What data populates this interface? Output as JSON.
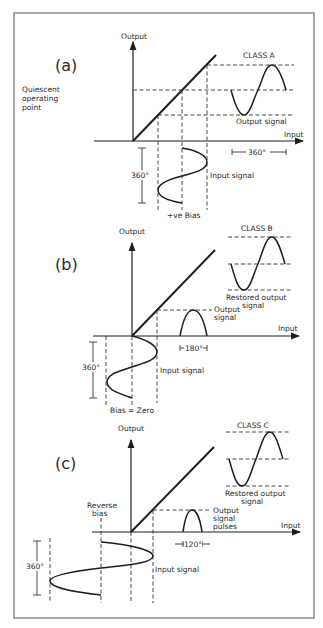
{
  "figure": {
    "frame": {
      "x": 14,
      "y": 13,
      "w": 300,
      "h": 605,
      "color": "#8a8a8a"
    },
    "panels": [
      {
        "id": "a",
        "panel_label": "(a)",
        "class_label": "CLASS A",
        "axis_labels": {
          "y": "Output",
          "x": "Input"
        },
        "annotations": {
          "quiescent": [
            "Quiescent",
            "operating",
            "point"
          ],
          "output": [
            "Output signal"
          ],
          "input": "Input signal",
          "bias": "+ve Bias",
          "input_span": "360°",
          "output_span": "360°"
        }
      },
      {
        "id": "b",
        "panel_label": "(b)",
        "class_label": "CLASS B",
        "axis_labels": {
          "y": "Output",
          "x": "Input"
        },
        "annotations": {
          "restored": [
            "Restored output",
            "signal"
          ],
          "output": [
            "Output",
            "signal"
          ],
          "input": "Input signal",
          "bias": "Bias = Zero",
          "input_span": "360°",
          "conduction": "180°"
        }
      },
      {
        "id": "c",
        "panel_label": "(c)",
        "class_label": "CLASS C",
        "axis_labels": {
          "y": "Output",
          "x": "Input"
        },
        "annotations": {
          "restored": [
            "Restored output",
            "signal"
          ],
          "output": [
            "Output",
            "signal",
            "pulses"
          ],
          "input": "Input signal",
          "bias": [
            "Reverse",
            "bias"
          ],
          "input_span": "360°",
          "conduction": "120°"
        }
      }
    ]
  }
}
